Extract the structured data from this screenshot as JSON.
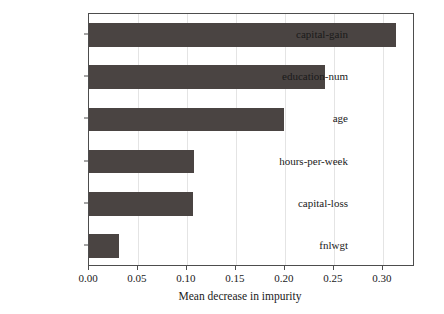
{
  "chart_data": {
    "type": "bar",
    "orientation": "horizontal",
    "title": "",
    "xlabel": "Mean decrease in impurity",
    "ylabel": "",
    "categories": [
      "capital-gain",
      "education-num",
      "age",
      "hours-per-week",
      "capital-loss",
      "fnlwgt"
    ],
    "values": [
      0.313,
      0.241,
      0.199,
      0.107,
      0.106,
      0.031
    ],
    "xlim": [
      0.0,
      0.3327
    ],
    "xticks": [
      0.0,
      0.05,
      0.1,
      0.15,
      0.2,
      0.25,
      0.3
    ],
    "xtick_labels": [
      "0.00",
      "0.05",
      "0.10",
      "0.15",
      "0.20",
      "0.25",
      "0.30"
    ],
    "grid": true,
    "grid_axis": "x",
    "legend": null,
    "bar_color": "#4a4442",
    "grid_color": "#e4e4e4",
    "axis_color": "#4d4d4d",
    "background_color": "#ffffff"
  }
}
